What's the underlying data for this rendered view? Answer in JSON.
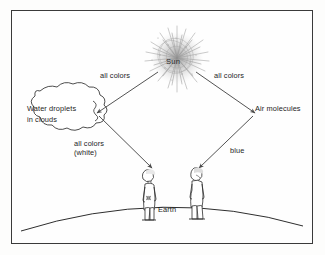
{
  "diagram": {
    "frame": {
      "border_color": "#3a3a3a",
      "background": "#fefefe"
    },
    "nodes": {
      "sun": {
        "label": "Sun",
        "icon": "sun-starburst-icon"
      },
      "cloud": {
        "label_line1": "Water droplets",
        "label_line2": "in clouds",
        "icon": "cloud-icon"
      },
      "air": {
        "label": "Air molecules"
      },
      "earth": {
        "label": "Earth",
        "icon": "earth-horizon-arc-icon"
      },
      "observer_left": {
        "icon": "person-figure-icon"
      },
      "observer_right": {
        "icon": "person-figure-icon"
      }
    },
    "arrows": [
      {
        "id": "sun-to-cloud",
        "label": "all colors"
      },
      {
        "id": "sun-to-air",
        "label": "all colors"
      },
      {
        "id": "cloud-to-observer",
        "label_line1": "all colors",
        "label_line2": "(white)"
      },
      {
        "id": "air-to-observer",
        "label": "blue"
      }
    ],
    "colors": {
      "ink": "#1d1d1d",
      "line": "#4a4a4a",
      "sun": "#b8b8b8"
    }
  }
}
